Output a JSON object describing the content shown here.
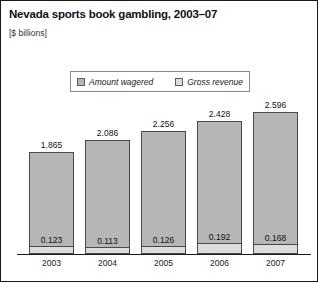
{
  "chart_data": {
    "type": "bar",
    "title": "Nevada sports book gambling, 2003–07",
    "subtitle": "[$ billions]",
    "xlabel": "",
    "ylabel": "",
    "ylim": [
      0,
      2.8
    ],
    "grid": false,
    "legend_position": "top-center",
    "stacked_note": "Gross revenue drawn as light band at base of each Amount wagered bar",
    "categories": [
      "2003",
      "2004",
      "2005",
      "2006",
      "2007"
    ],
    "series": [
      {
        "name": "Amount wagered",
        "color": "#b6b6b6",
        "values": [
          1.865,
          2.086,
          2.256,
          2.428,
          2.596
        ],
        "labels": [
          "1.865",
          "2.086",
          "2.256",
          "2.428",
          "2.596"
        ]
      },
      {
        "name": "Gross revenue",
        "color": "#dcdcdc",
        "values": [
          0.123,
          0.113,
          0.126,
          0.192,
          0.168
        ],
        "labels": [
          "0.123",
          "0.113",
          "0.126",
          "0.192",
          "0.168"
        ]
      }
    ]
  },
  "legend": {
    "items": [
      {
        "label": "Amount wagered"
      },
      {
        "label": "Gross revenue"
      }
    ]
  }
}
